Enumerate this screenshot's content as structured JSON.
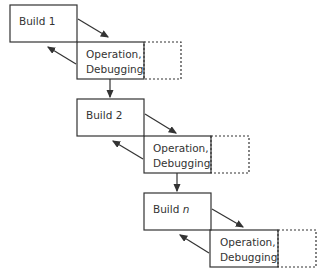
{
  "diagram": {
    "stages": [
      {
        "build": "Build 1",
        "build_prefix": "Build ",
        "build_suffix": "1",
        "op_line1": "Operation,",
        "op_line2": "Debugging"
      },
      {
        "build": "Build 2",
        "build_prefix": "Build ",
        "build_suffix": "2",
        "op_line1": "Operation,",
        "op_line2": "Debugging"
      },
      {
        "build": "Build n",
        "build_prefix": "Build ",
        "build_suffix": "n",
        "op_line1": "Operation,",
        "op_line2": "Debugging"
      }
    ],
    "colors": {
      "stroke": "#333333",
      "background": "#ffffff"
    }
  }
}
